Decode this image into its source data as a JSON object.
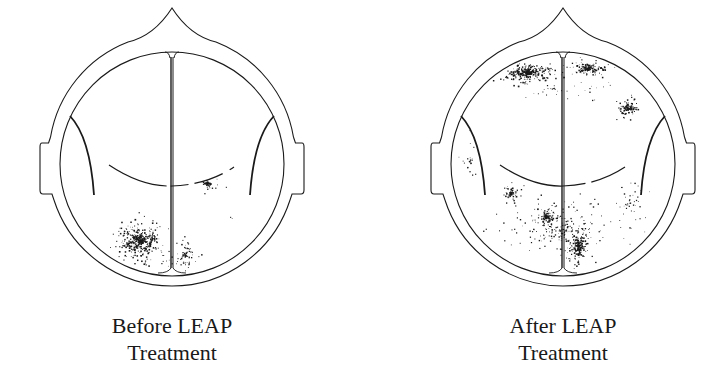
{
  "figure": {
    "background": "#ffffff",
    "ink_color": "#1a1a1a",
    "panels": [
      {
        "id": "before",
        "caption_line1": "Before LEAP",
        "caption_line2": "Treatment",
        "center_x": 172,
        "activity_regions": [
          {
            "name": "left-occipital-posterior",
            "cx": 140,
            "cy": 240,
            "rx": 38,
            "ry": 30,
            "density": 520,
            "intensity": 0.95
          },
          {
            "name": "right-posterior-spillover",
            "cx": 185,
            "cy": 255,
            "rx": 22,
            "ry": 25,
            "density": 130,
            "intensity": 0.6
          },
          {
            "name": "right-central-focus",
            "cx": 207,
            "cy": 183,
            "rx": 6,
            "ry": 6,
            "density": 45,
            "intensity": 1.0
          },
          {
            "name": "right-central-halo",
            "cx": 208,
            "cy": 186,
            "rx": 18,
            "ry": 16,
            "density": 40,
            "intensity": 0.35
          },
          {
            "name": "right-parietal-speck",
            "cx": 230,
            "cy": 217,
            "rx": 4,
            "ry": 5,
            "density": 8,
            "intensity": 0.4
          }
        ]
      },
      {
        "id": "after",
        "caption_line1": "After LEAP",
        "caption_line2": "Treatment",
        "center_x": 563,
        "activity_regions": [
          {
            "name": "frontal-left-band",
            "cx": 528,
            "cy": 72,
            "rx": 40,
            "ry": 14,
            "density": 420,
            "intensity": 0.95
          },
          {
            "name": "frontal-right-band",
            "cx": 588,
            "cy": 68,
            "rx": 25,
            "ry": 11,
            "density": 190,
            "intensity": 0.9
          },
          {
            "name": "frontal-haze",
            "cx": 555,
            "cy": 88,
            "rx": 70,
            "ry": 14,
            "density": 120,
            "intensity": 0.4
          },
          {
            "name": "right-frontal-focus",
            "cx": 628,
            "cy": 108,
            "rx": 18,
            "ry": 13,
            "density": 150,
            "intensity": 0.8
          },
          {
            "name": "left-temporal-focus",
            "cx": 510,
            "cy": 193,
            "rx": 11,
            "ry": 12,
            "density": 110,
            "intensity": 0.85
          },
          {
            "name": "left-parietal-focus",
            "cx": 546,
            "cy": 216,
            "rx": 13,
            "ry": 11,
            "density": 130,
            "intensity": 0.9
          },
          {
            "name": "right-occipital-focus",
            "cx": 578,
            "cy": 245,
            "rx": 15,
            "ry": 25,
            "density": 230,
            "intensity": 0.9
          },
          {
            "name": "posterior-diffuse",
            "cx": 560,
            "cy": 230,
            "rx": 95,
            "ry": 45,
            "density": 620,
            "intensity": 0.45
          },
          {
            "name": "left-lateral-diffuse",
            "cx": 470,
            "cy": 160,
            "rx": 12,
            "ry": 40,
            "density": 60,
            "intensity": 0.35
          },
          {
            "name": "right-lateral-diffuse",
            "cx": 630,
            "cy": 200,
            "rx": 22,
            "ry": 35,
            "density": 120,
            "intensity": 0.4
          }
        ]
      }
    ]
  }
}
